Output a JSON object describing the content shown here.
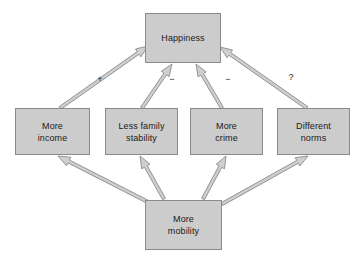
{
  "diagram": {
    "background_color": "#ffffff",
    "node_fill_color": "#cccccc",
    "node_border_color": "#8a8a8a",
    "arrow_fill_color": "#cfcfcf",
    "arrow_stroke_color": "#8a8a8a",
    "text_color": "#1a1a1a",
    "nodes": [
      {
        "id": "happiness",
        "label": "Happiness",
        "x": 145,
        "y": 13,
        "w": 76,
        "h": 50
      },
      {
        "id": "more-income",
        "label": "More\nincome",
        "x": 15,
        "y": 108,
        "w": 75,
        "h": 47
      },
      {
        "id": "less-family-stability",
        "label": "Less family\nstability",
        "x": 105,
        "y": 108,
        "w": 73,
        "h": 47
      },
      {
        "id": "more-crime",
        "label": "More\ncrime",
        "x": 190,
        "y": 108,
        "w": 73,
        "h": 47
      },
      {
        "id": "different-norms",
        "label": "Different\nnorms",
        "x": 277,
        "y": 108,
        "w": 73,
        "h": 47
      },
      {
        "id": "more-mobility",
        "label": "More\nmobility",
        "x": 145,
        "y": 200,
        "w": 77,
        "h": 50
      }
    ],
    "edges": [
      {
        "id": "income-to-happiness",
        "from": "more-income",
        "to": "happiness",
        "sign": "+"
      },
      {
        "id": "family-to-happiness",
        "from": "less-family-stability",
        "to": "happiness",
        "sign": "−"
      },
      {
        "id": "crime-to-happiness",
        "from": "more-crime",
        "to": "happiness",
        "sign": "−"
      },
      {
        "id": "norms-to-happiness",
        "from": "different-norms",
        "to": "happiness",
        "sign": "?"
      },
      {
        "id": "mobility-to-income",
        "from": "more-mobility",
        "to": "more-income",
        "sign": ""
      },
      {
        "id": "mobility-to-family",
        "from": "more-mobility",
        "to": "less-family-stability",
        "sign": ""
      },
      {
        "id": "mobility-to-crime",
        "from": "more-mobility",
        "to": "more-crime",
        "sign": ""
      },
      {
        "id": "mobility-to-norms",
        "from": "more-mobility",
        "to": "different-norms",
        "sign": ""
      }
    ],
    "edge_labels": [
      {
        "id": "plus-label",
        "text": "+",
        "x": 100,
        "y": 75
      },
      {
        "id": "minus-family-label",
        "text": "−",
        "x": 172,
        "y": 75
      },
      {
        "id": "minus-crime-label",
        "text": "−",
        "x": 228,
        "y": 75
      },
      {
        "id": "question-label",
        "text": "?",
        "x": 291,
        "y": 73
      }
    ]
  }
}
